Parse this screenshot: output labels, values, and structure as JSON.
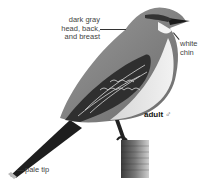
{
  "figure": {
    "labels": {
      "head": [
        "dark gray",
        "head, back,",
        "and breast"
      ],
      "chin": [
        "white",
        "chin"
      ],
      "age_sex": "adult",
      "sex_symbol": "♂",
      "tail": "pale tip"
    },
    "colors": {
      "background": "#ffffff",
      "body_gray": "#8a8a8a",
      "belly": "#e6e6e6",
      "wing_dark": "#2b2b2b",
      "text": "#444444"
    }
  }
}
